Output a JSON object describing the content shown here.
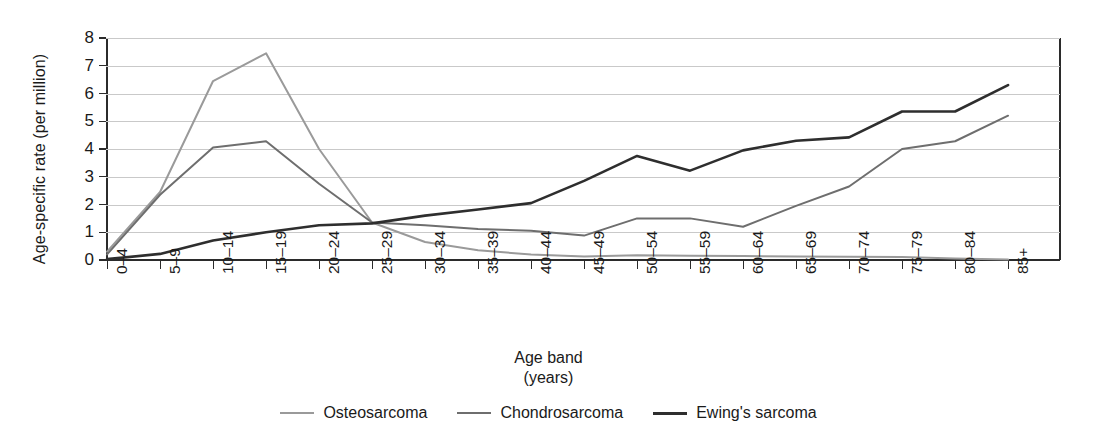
{
  "chart_data": {
    "type": "line",
    "title": "",
    "xlabel": "Age band",
    "xlabel_unit": "(years)",
    "ylabel": "Age-specific rate (per million)",
    "ylim": [
      0,
      8
    ],
    "yticks": [
      0,
      1,
      2,
      3,
      4,
      5,
      6,
      7,
      8
    ],
    "grid": true,
    "legend_position": "bottom-center",
    "categories": [
      "0–4",
      "5–9",
      "10–14",
      "15–19",
      "20–24",
      "25–29",
      "30–34",
      "35–39",
      "40–44",
      "45–49",
      "50–54",
      "55–59",
      "60–64",
      "65–69",
      "70–74",
      "75–79",
      "80–84",
      "85+"
    ],
    "series": [
      {
        "name": "Osteosarcoma",
        "color": "#9a9a9a",
        "width": 2.0,
        "values": [
          0.3,
          2.45,
          6.45,
          7.45,
          4.0,
          1.35,
          0.65,
          0.35,
          0.2,
          0.13,
          0.17,
          0.15,
          0.14,
          0.13,
          0.12,
          0.11,
          0.05,
          0.02
        ]
      },
      {
        "name": "Chondrosarcoma",
        "color": "#6e6e6e",
        "width": 2.0,
        "values": [
          0.2,
          2.35,
          4.05,
          4.28,
          2.75,
          1.35,
          1.25,
          1.12,
          1.05,
          0.88,
          1.5,
          1.5,
          1.2,
          1.95,
          2.65,
          4.0,
          4.28,
          5.2
        ]
      },
      {
        "name": "Ewing's sarcoma",
        "color": "#2e2e2e",
        "width": 2.6,
        "values": [
          0.03,
          0.22,
          0.7,
          1.0,
          1.25,
          1.32,
          1.6,
          1.82,
          2.05,
          2.85,
          3.75,
          3.22,
          3.95,
          4.3,
          4.42,
          5.35,
          5.35,
          6.3
        ]
      }
    ]
  },
  "axis": {
    "ytick_labels": [
      "0",
      "1",
      "2",
      "3",
      "4",
      "5",
      "6",
      "7",
      "8"
    ]
  }
}
